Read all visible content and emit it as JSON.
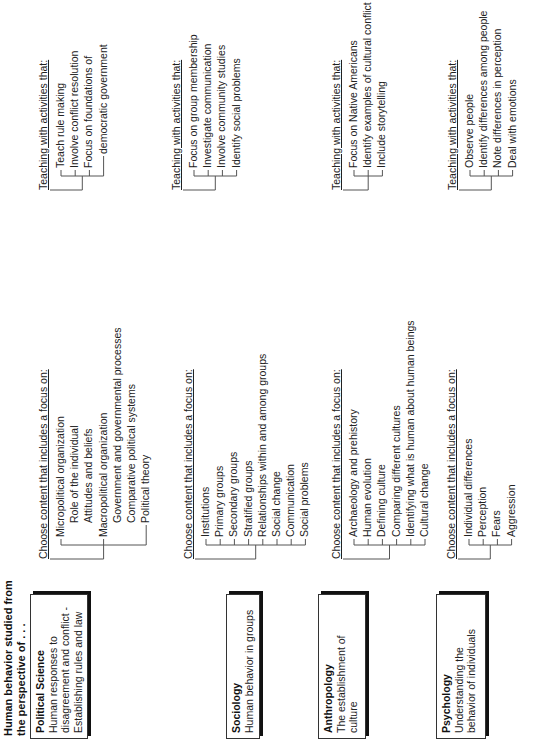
{
  "header": {
    "line1": "Human behavior studied from",
    "line2": "the perspective of . . ."
  },
  "sections": [
    {
      "discipline": "Political Science",
      "description": "Human responses to\ndisagreement and conflict -\nEstablishing rules and law",
      "content_heading": "Choose content that includes a focus on:",
      "content_items": [
        {
          "label": "Micropolitical organization",
          "level": 0
        },
        {
          "label": "Role of the individual",
          "level": 1
        },
        {
          "label": "Attitudes and beliefs",
          "level": 1
        },
        {
          "label": "Macropolitical organization",
          "level": 0
        },
        {
          "label": "Government and governmental processes",
          "level": 1
        },
        {
          "label": "Comparative political systems",
          "level": 1
        },
        {
          "label": "Political theory",
          "level": 1
        }
      ],
      "activities_heading": "Teaching with activities that:",
      "activities": [
        {
          "label": "Teach rule making",
          "level": 0
        },
        {
          "label": "Involve conflict resolution",
          "level": 0
        },
        {
          "label": "Focus on foundations of",
          "level": 0
        },
        {
          "label": "democratic government",
          "level": 1
        }
      ]
    },
    {
      "discipline": "Sociology",
      "description": "Human behavior in groups",
      "content_heading": "Choose content that includes a focus on:",
      "content_items": [
        {
          "label": "Institutions",
          "level": 0
        },
        {
          "label": "Primary groups",
          "level": 0
        },
        {
          "label": "Secondary groups",
          "level": 0
        },
        {
          "label": "Stratified groups",
          "level": 0
        },
        {
          "label": "Relationships within and among groups",
          "level": 0
        },
        {
          "label": "Social change",
          "level": 0
        },
        {
          "label": "Communication",
          "level": 0
        },
        {
          "label": "Social problems",
          "level": 0
        }
      ],
      "activities_heading": "Teaching with activities that:",
      "activities": [
        {
          "label": "Focus on group membership",
          "level": 0
        },
        {
          "label": "Investigate communication",
          "level": 0
        },
        {
          "label": "Involve community studies",
          "level": 0
        },
        {
          "label": "Identify social problems",
          "level": 0
        }
      ]
    },
    {
      "discipline": "Anthropology",
      "description": "The establishment of\nculture",
      "content_heading": "Choose content that includes a focus on:",
      "content_items": [
        {
          "label": "Archaeology and prehistory",
          "level": 0
        },
        {
          "label": "Human evolution",
          "level": 0
        },
        {
          "label": "Defining culture",
          "level": 0
        },
        {
          "label": "Comparing different cultures",
          "level": 0
        },
        {
          "label": "Identifying what is human about human beings",
          "level": 0
        },
        {
          "label": "Cultural change",
          "level": 0
        }
      ],
      "activities_heading": "Teaching with activities that:",
      "activities": [
        {
          "label": "Focus on Native Americans",
          "level": 0
        },
        {
          "label": "Identify examples of cultural conflict",
          "level": 0
        },
        {
          "label": "Include storytelling",
          "level": 0
        }
      ]
    },
    {
      "discipline": "Psychology",
      "description": "Understanding the\nbehavior of individuals",
      "content_heading": "Choose content that includes a focus on:",
      "content_items": [
        {
          "label": "Individual differences",
          "level": 0
        },
        {
          "label": "Perception",
          "level": 0
        },
        {
          "label": "Fears",
          "level": 0
        },
        {
          "label": "Aggression",
          "level": 0
        }
      ],
      "activities_heading": "Teaching with activities that:",
      "activities": [
        {
          "label": "Observe people",
          "level": 0
        },
        {
          "label": "Identify differences among people",
          "level": 0
        },
        {
          "label": "Note differences in perception",
          "level": 0
        },
        {
          "label": "Deal with emotions",
          "level": 0
        }
      ]
    }
  ]
}
